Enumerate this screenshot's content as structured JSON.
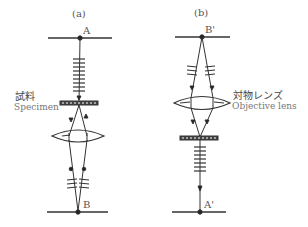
{
  "panels": [
    {
      "id": "a",
      "label": "(a)",
      "top_point": "A",
      "bottom_point": "B",
      "element_label_jp": "試料",
      "element_label_en": "Specimen"
    },
    {
      "id": "b",
      "label": "(b)",
      "top_point": "B'",
      "bottom_point": "A'",
      "element_label_jp": "対物レンズ",
      "element_label_en": "Objective lens"
    }
  ],
  "colors": {
    "line": "#333333",
    "text": "#555555"
  }
}
